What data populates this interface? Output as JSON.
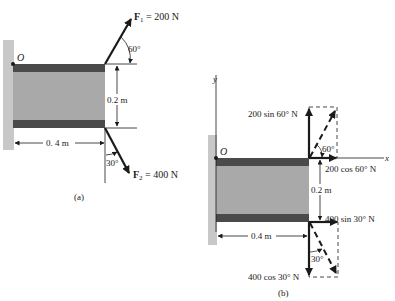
{
  "figure_a": {
    "caption": "(a)",
    "origin_label": "O",
    "force1": {
      "symbol": "F",
      "subscript": "1",
      "value": " = 200 N",
      "angle_label": "60°"
    },
    "force2": {
      "symbol": "F",
      "subscript": "2",
      "value": " = 400 N",
      "angle_label": "30°"
    },
    "height_dim": "0.2 m",
    "width_dim": "0. 4 m"
  },
  "figure_b": {
    "caption": "(b)",
    "origin_label": "O",
    "x_axis_label": "x",
    "y_axis_label": "y",
    "f1_vertical_label": "200 sin 60° N",
    "f1_horizontal_label": "200 cos 60° N",
    "f1_angle_label": "60°",
    "f2_horizontal_label": "400 sin 30° N",
    "f2_vertical_label": "400 cos 30° N",
    "f2_angle_label": "30°",
    "height_dim": "0.2 m",
    "width_dim": "0.4 m"
  },
  "colors": {
    "wall": "#c8c8c8",
    "body": "#a9a9a9",
    "strip": "#4a4a4a",
    "ink": "#1a1a1a"
  }
}
